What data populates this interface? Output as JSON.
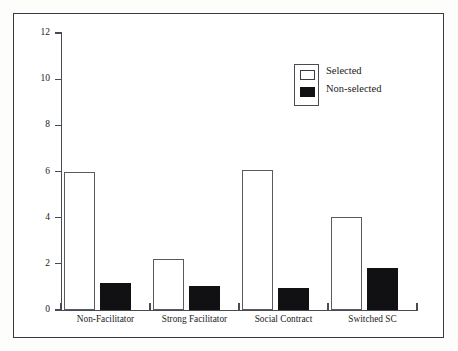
{
  "chart_data": {
    "type": "bar",
    "title": "",
    "subtitle": "",
    "xlabel": "",
    "ylabel": "",
    "categories": [
      "Non-Facilitator",
      "Strong Facilitator",
      "Social Contract",
      "Switched SC"
    ],
    "series": [
      {
        "name": "Selected",
        "values": [
          6.0,
          2.2,
          6.05,
          4.05
        ],
        "color": "#ffffff",
        "edge_color": "#5a5a62"
      },
      {
        "name": "Non-selected",
        "values": [
          1.15,
          1.05,
          0.95,
          1.8
        ],
        "color": "#111114",
        "edge_color": "#111114"
      }
    ],
    "ylim": [
      0,
      12
    ],
    "yticks": [
      0,
      2,
      4,
      6,
      8,
      10,
      12
    ],
    "ytick_labels": [
      "0",
      "2",
      "4",
      "6",
      "8",
      "10",
      "12"
    ],
    "grid": false,
    "legend_position": "upper right",
    "legend_entries": [
      "Selected",
      "Non-selected"
    ],
    "annotations": []
  },
  "figure": {
    "background_color": "#ffffff",
    "frame_color": "#3a3a42",
    "axis_color": "#4a4a52"
  }
}
